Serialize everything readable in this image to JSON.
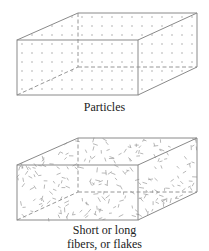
{
  "diagram": {
    "panels": [
      {
        "id": "particles",
        "caption": "Particles",
        "reinforcement_type": "particles",
        "shape": "rectangular-box"
      },
      {
        "id": "fibers",
        "caption_line1": "Short or long",
        "caption_line2": "fibers, or flakes",
        "reinforcement_type": "fibers-or-flakes",
        "shape": "rectangular-box"
      }
    ],
    "colors": {
      "edge": "#8a8a8a",
      "filler": "#9a9a9a",
      "caption": "#222222",
      "background": "#ffffff"
    }
  }
}
